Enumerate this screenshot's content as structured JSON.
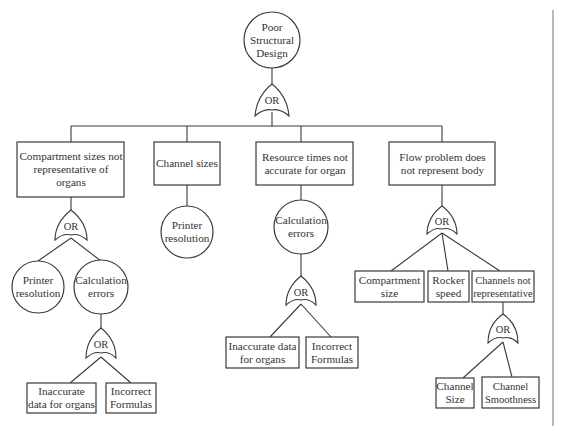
{
  "diagram": {
    "type": "fault-tree",
    "top_event": "Poor Structural Design",
    "gate_label": "OR",
    "branches": [
      {
        "label": "Compartment sizes not representative of organs",
        "gate": "OR",
        "children": [
          {
            "label": "Printer resolution",
            "shape": "circle"
          },
          {
            "label": "Calculation errors",
            "shape": "circle",
            "gate": "OR",
            "children": [
              {
                "label": "Inaccurate data for organs",
                "shape": "box"
              },
              {
                "label": "Incorrect Formulas",
                "shape": "box"
              }
            ]
          }
        ]
      },
      {
        "label": "Channel sizes",
        "children": [
          {
            "label": "Printer resolution",
            "shape": "circle"
          }
        ]
      },
      {
        "label": "Resource times not accurate for organ",
        "children": [
          {
            "label": "Calculation errors",
            "shape": "circle",
            "gate": "OR",
            "children": [
              {
                "label": "Inaccurate data for organs",
                "shape": "box"
              },
              {
                "label": "Incorrect Formulas",
                "shape": "box"
              }
            ]
          }
        ]
      },
      {
        "label": "Flow problem does not represent body",
        "gate": "OR",
        "children": [
          {
            "label": "Compartment size",
            "shape": "box"
          },
          {
            "label": "Rocker speed",
            "shape": "box"
          },
          {
            "label": "Channels not representative",
            "shape": "box",
            "gate": "OR",
            "children": [
              {
                "label": "Channel Size",
                "shape": "box"
              },
              {
                "label": "Channel Smoothness",
                "shape": "box"
              }
            ]
          }
        ]
      }
    ]
  },
  "nodes": {
    "top": "Poor Structural Design",
    "b1": "Compartment sizes not representative of organs",
    "b2": "Channel sizes",
    "b3": "Resource times not accurate for organ",
    "b4": "Flow problem does not represent body",
    "b1_c1": "Printer resolution",
    "b1_c2": "Calculation errors",
    "b1_c2_l1": "Inaccurate data for organs",
    "b1_c2_l2": "Incorrect Formulas",
    "b2_c1": "Printer resolution",
    "b3_c1": "Calculation errors",
    "b3_c1_l1": "Inaccurate data for organs",
    "b3_c1_l2": "Incorrect Formulas",
    "b4_c1": "Compartment size",
    "b4_c2": "Rocker speed",
    "b4_c3": "Channels not representative",
    "b4_c3_l1": "Channel Size",
    "b4_c3_l2": "Channel Smoothness"
  },
  "gates": {
    "g_top": "OR",
    "g_b1": "OR",
    "g_b1_c2": "OR",
    "g_b3_c1": "OR",
    "g_b4": "OR",
    "g_b4_c3": "OR"
  },
  "colors": {
    "line": "#3a3a3a",
    "text": "#333333",
    "background": "#ffffff",
    "border": "#8a8a8a"
  }
}
